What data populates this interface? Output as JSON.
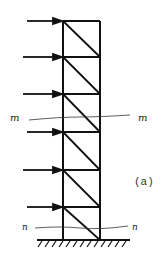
{
  "diagram": {
    "type": "truss-tower",
    "caption": "(a)",
    "panels": 6,
    "lateral_loads": 6,
    "sections": [
      {
        "name": "m-m",
        "label_left": "m",
        "label_right": "m"
      },
      {
        "name": "n-n",
        "label_left": "n",
        "label_right": "n"
      }
    ],
    "support": "fixed ground (hatched)",
    "colors": {
      "line": "#111111",
      "background": "#ffffff"
    }
  }
}
